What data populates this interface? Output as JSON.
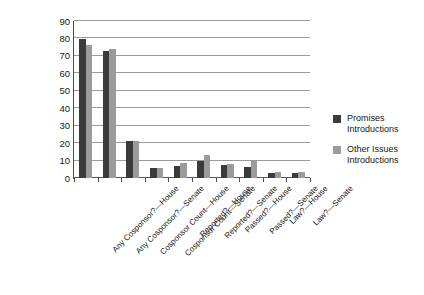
{
  "chart_data": {
    "type": "bar",
    "title": "",
    "subtitle": "",
    "xlabel": "",
    "ylabel": "",
    "ylim": [
      0,
      90
    ],
    "ytick_step": 10,
    "yticks": [
      90,
      80,
      70,
      60,
      50,
      40,
      30,
      20,
      10,
      0
    ],
    "grid": true,
    "legend_position": "right",
    "orientation": "vertical",
    "grouping": "grouped",
    "categories": [
      "Any Cosponsor?—House",
      "Any Cosponsor?—Senate",
      "Cosponsor Count—House",
      "Cosponsor Count—Senate",
      "Reported?—House",
      "Reported?—Senate",
      "Passed?—House",
      "Passed?—Senate",
      "Law?—House",
      "Law?—Senate"
    ],
    "series": [
      {
        "name": "Promises Introductions",
        "color": "#3b3b3b",
        "values": [
          79.5,
          73.0,
          21.5,
          5.5,
          7.0,
          9.5,
          7.5,
          6.5,
          3.0,
          3.0
        ]
      },
      {
        "name": "Other Issues Introductions",
        "color": "#9b9b9b",
        "values": [
          76.0,
          74.0,
          21.5,
          6.0,
          8.5,
          13.0,
          8.0,
          9.5,
          3.2,
          3.5
        ]
      }
    ]
  },
  "legend": {
    "entries": [
      {
        "label_line1": "Promises",
        "label_line2": "Introductions",
        "swatch": "dark-swatch"
      },
      {
        "label_line1": "Other Issues",
        "label_line2": "Introductions",
        "swatch": "light-swatch"
      }
    ]
  }
}
